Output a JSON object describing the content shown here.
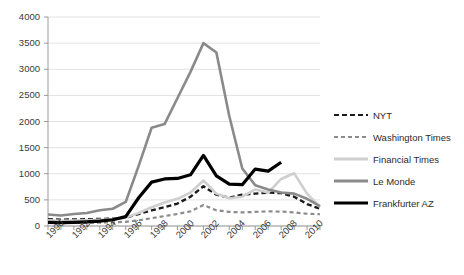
{
  "chart_data": {
    "type": "line",
    "title": "",
    "xlabel": "",
    "ylabel": "",
    "xlim": [
      1990,
      2011
    ],
    "ylim": [
      0,
      4000
    ],
    "ytick_step": 500,
    "grid": true,
    "legend_position": "right",
    "yticks": [
      "0",
      "500",
      "1000",
      "1500",
      "2000",
      "2500",
      "3000",
      "3500",
      "4000"
    ],
    "xticks": [
      "1990",
      "1992",
      "1994",
      "1996",
      "1998",
      "2000",
      "2002",
      "2004",
      "2006",
      "2008",
      "2010"
    ],
    "x": [
      1990,
      1991,
      1992,
      1993,
      1994,
      1995,
      1996,
      1997,
      1998,
      1999,
      2000,
      2001,
      2002,
      2003,
      2004,
      2005,
      2006,
      2007,
      2008,
      2009,
      2010,
      2011
    ],
    "series": [
      {
        "name": "NYT",
        "color": "#1a1a1a",
        "style": "dashed",
        "width": 2.4,
        "values": [
          130,
          120,
          125,
          130,
          135,
          140,
          160,
          230,
          300,
          360,
          430,
          560,
          760,
          600,
          540,
          600,
          620,
          640,
          630,
          560,
          420,
          330
        ]
      },
      {
        "name": "Washington Times",
        "color": "#8c8c8c",
        "style": "dashed",
        "width": 2.2,
        "values": [
          60,
          55,
          60,
          60,
          65,
          70,
          80,
          110,
          150,
          190,
          230,
          280,
          400,
          300,
          270,
          260,
          270,
          280,
          275,
          260,
          235,
          225
        ]
      },
      {
        "name": "Financial Times",
        "color": "#cfcfcf",
        "style": "solid",
        "width": 2.6,
        "values": [
          110,
          100,
          105,
          110,
          120,
          130,
          160,
          250,
          360,
          450,
          520,
          640,
          870,
          620,
          530,
          560,
          700,
          640,
          900,
          1010,
          620,
          360
        ]
      },
      {
        "name": "Le Monde",
        "color": "#8a8a8a",
        "style": "solid",
        "width": 2.6,
        "values": [
          220,
          200,
          230,
          250,
          300,
          330,
          460,
          1150,
          1880,
          1950,
          2450,
          2950,
          3500,
          3320,
          2100,
          1100,
          780,
          700,
          640,
          620,
          520,
          380
        ]
      },
      {
        "name": "Frankfurter AZ",
        "color": "#000000",
        "style": "solid",
        "width": 3.2,
        "values": [
          70,
          65,
          70,
          80,
          95,
          120,
          180,
          540,
          840,
          900,
          910,
          980,
          1350,
          960,
          800,
          790,
          1090,
          1050,
          1220,
          null,
          null,
          null
        ]
      }
    ]
  },
  "legend": {
    "items": [
      {
        "label": "NYT"
      },
      {
        "label": "Washington Times"
      },
      {
        "label": "Financial Times"
      },
      {
        "label": "Le Monde"
      },
      {
        "label": "Frankfurter AZ"
      }
    ]
  }
}
